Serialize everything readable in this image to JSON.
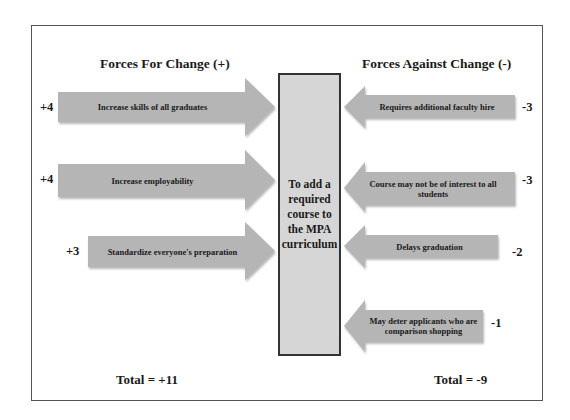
{
  "diagram": {
    "type": "force-field-analysis",
    "center": {
      "label": "To add a required course to the MPA curriculum"
    },
    "for_change": {
      "heading": "Forces For Change (+)",
      "forces": [
        {
          "label": "Increase skills of all graduates",
          "score": "+4"
        },
        {
          "label": "Increase employability",
          "score": "+4"
        },
        {
          "label": "Standardize everyone's preparation",
          "score": "+3"
        }
      ],
      "total": "Total = +11"
    },
    "against_change": {
      "heading": "Forces Against Change (-)",
      "forces": [
        {
          "label": "Requires additional faculty hire",
          "score": "-3"
        },
        {
          "label": "Course may not be of interest to all students",
          "score": "-3"
        },
        {
          "label": "Delays graduation",
          "score": "-2"
        },
        {
          "label": "May deter applicants who are comparison shopping",
          "score": "-1"
        }
      ],
      "total": "Total = -9"
    },
    "colors": {
      "arrow_fill": "#b5b5b5",
      "center_fill": "#d6d6d6",
      "border": "#333333"
    }
  }
}
